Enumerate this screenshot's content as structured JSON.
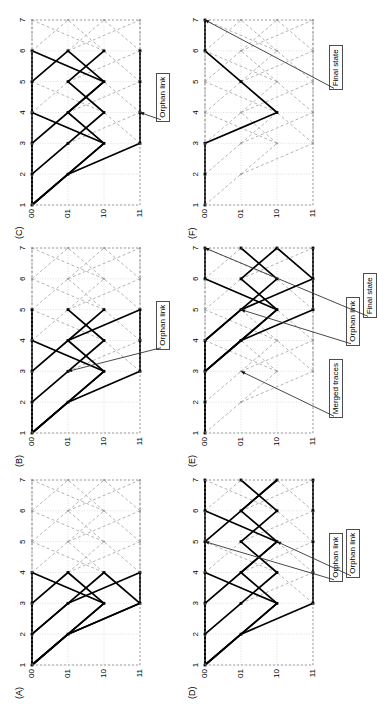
{
  "figure": {
    "orientation": "rotated-90-ccw",
    "canvas": {
      "width": 325,
      "height": 705
    },
    "background": "#ffffff",
    "colors": {
      "trellis_dashed": "#9a9a9a",
      "survivor_path": "#000000",
      "grid": "#c8c8c8",
      "annotation_border": "#4d4d4d",
      "text": "#000000"
    },
    "axes": {
      "time_label_values": [
        "1",
        "2",
        "3",
        "4",
        "5",
        "6",
        "7"
      ],
      "state_label_values": [
        "00",
        "01",
        "10",
        "11"
      ],
      "time_count": 7,
      "state_count": 4
    }
  },
  "panels": [
    {
      "id": "A",
      "label": "(A)",
      "grid_pos": {
        "row": 0,
        "col": 0
      },
      "time_labels": [
        "1",
        "2",
        "3",
        "4",
        "5",
        "6",
        "7"
      ],
      "state_labels": [
        "00",
        "01",
        "10",
        "11"
      ],
      "decoded_depth": 4,
      "annotations": [],
      "survivor_paths": [
        [
          [
            1,
            0
          ],
          [
            2,
            0
          ],
          [
            3,
            0
          ],
          [
            4,
            0
          ]
        ],
        [
          [
            1,
            0
          ],
          [
            2,
            0
          ],
          [
            3,
            0
          ],
          [
            4,
            1
          ]
        ],
        [
          [
            1,
            0
          ],
          [
            2,
            0
          ],
          [
            3,
            1
          ],
          [
            4,
            2
          ]
        ],
        [
          [
            1,
            0
          ],
          [
            2,
            0
          ],
          [
            3,
            1
          ],
          [
            4,
            3
          ]
        ],
        [
          [
            1,
            0
          ],
          [
            2,
            1
          ],
          [
            3,
            2
          ],
          [
            4,
            1
          ]
        ],
        [
          [
            1,
            0
          ],
          [
            2,
            1
          ],
          [
            3,
            2
          ],
          [
            4,
            0
          ]
        ],
        [
          [
            1,
            0
          ],
          [
            2,
            1
          ],
          [
            3,
            3
          ],
          [
            4,
            2
          ]
        ],
        [
          [
            1,
            0
          ],
          [
            2,
            1
          ],
          [
            3,
            3
          ],
          [
            4,
            3
          ]
        ]
      ]
    },
    {
      "id": "B",
      "label": "(B)",
      "grid_pos": {
        "row": 0,
        "col": 1
      },
      "time_labels": [
        "1",
        "2",
        "3",
        "4",
        "5",
        "6",
        "7"
      ],
      "state_labels": [
        "00",
        "01",
        "10",
        "11"
      ],
      "decoded_depth": 5,
      "annotations": [
        {
          "text": "Orphan link",
          "target_time": 3,
          "target_state": 1
        }
      ],
      "survivor_paths": [
        [
          [
            1,
            0
          ],
          [
            2,
            0
          ],
          [
            3,
            0
          ],
          [
            4,
            0
          ],
          [
            5,
            0
          ]
        ],
        [
          [
            1,
            0
          ],
          [
            2,
            0
          ],
          [
            3,
            0
          ],
          [
            4,
            1
          ],
          [
            5,
            2
          ]
        ],
        [
          [
            1,
            0
          ],
          [
            2,
            0
          ],
          [
            3,
            1
          ],
          [
            4,
            2
          ],
          [
            5,
            1
          ]
        ],
        [
          [
            1,
            0
          ],
          [
            2,
            1
          ],
          [
            3,
            2
          ],
          [
            4,
            1
          ],
          [
            5,
            3
          ]
        ],
        [
          [
            1,
            0
          ],
          [
            2,
            1
          ],
          [
            3,
            3
          ],
          [
            4,
            3
          ],
          [
            5,
            3
          ]
        ],
        [
          [
            1,
            0
          ],
          [
            2,
            1
          ],
          [
            3,
            2
          ],
          [
            4,
            0
          ],
          [
            5,
            0
          ]
        ]
      ]
    },
    {
      "id": "C",
      "label": "(C)",
      "grid_pos": {
        "row": 0,
        "col": 2
      },
      "time_labels": [
        "1",
        "2",
        "3",
        "4",
        "5",
        "6",
        "7"
      ],
      "state_labels": [
        "00",
        "01",
        "10",
        "11"
      ],
      "decoded_depth": 6,
      "annotations": [
        {
          "text": "Orphan link",
          "target_time": 4,
          "target_state": 3
        }
      ],
      "survivor_paths": [
        [
          [
            1,
            0
          ],
          [
            2,
            0
          ],
          [
            3,
            0
          ],
          [
            4,
            0
          ],
          [
            5,
            0
          ],
          [
            6,
            0
          ]
        ],
        [
          [
            1,
            0
          ],
          [
            2,
            0
          ],
          [
            3,
            0
          ],
          [
            4,
            1
          ],
          [
            5,
            2
          ],
          [
            6,
            1
          ]
        ],
        [
          [
            1,
            0
          ],
          [
            2,
            1
          ],
          [
            3,
            2
          ],
          [
            4,
            1
          ],
          [
            5,
            2
          ],
          [
            6,
            0
          ]
        ],
        [
          [
            1,
            0
          ],
          [
            2,
            1
          ],
          [
            3,
            3
          ],
          [
            4,
            3
          ],
          [
            5,
            3
          ],
          [
            6,
            3
          ]
        ],
        [
          [
            1,
            0
          ],
          [
            2,
            0
          ],
          [
            3,
            1
          ],
          [
            4,
            2
          ],
          [
            5,
            1
          ],
          [
            6,
            2
          ]
        ],
        [
          [
            1,
            0
          ],
          [
            2,
            1
          ],
          [
            3,
            2
          ],
          [
            4,
            0
          ],
          [
            5,
            0
          ],
          [
            6,
            1
          ]
        ]
      ]
    },
    {
      "id": "D",
      "label": "(D)",
      "grid_pos": {
        "row": 1,
        "col": 0
      },
      "time_labels": [
        "1",
        "2",
        "3",
        "4",
        "5",
        "6",
        "7"
      ],
      "state_labels": [
        "00",
        "01",
        "10",
        "11"
      ],
      "decoded_depth": 7,
      "annotations": [
        {
          "text": "Orphan link",
          "target_time": 5,
          "target_state": 0
        },
        {
          "text": "Orphan link",
          "target_time": 5,
          "target_state": 2
        }
      ],
      "survivor_paths": [
        [
          [
            1,
            0
          ],
          [
            2,
            0
          ],
          [
            3,
            0
          ],
          [
            4,
            0
          ],
          [
            5,
            0
          ],
          [
            6,
            0
          ],
          [
            7,
            0
          ]
        ],
        [
          [
            1,
            0
          ],
          [
            2,
            0
          ],
          [
            3,
            0
          ],
          [
            4,
            1
          ],
          [
            5,
            2
          ],
          [
            6,
            1
          ],
          [
            7,
            2
          ]
        ],
        [
          [
            1,
            0
          ],
          [
            2,
            1
          ],
          [
            3,
            2
          ],
          [
            4,
            1
          ],
          [
            5,
            2
          ],
          [
            6,
            0
          ],
          [
            7,
            0
          ]
        ],
        [
          [
            1,
            0
          ],
          [
            2,
            1
          ],
          [
            3,
            3
          ],
          [
            4,
            3
          ],
          [
            5,
            3
          ],
          [
            6,
            3
          ],
          [
            7,
            3
          ]
        ],
        [
          [
            1,
            0
          ],
          [
            2,
            0
          ],
          [
            3,
            1
          ],
          [
            4,
            2
          ],
          [
            5,
            1
          ],
          [
            6,
            2
          ],
          [
            7,
            1
          ]
        ],
        [
          [
            1,
            0
          ],
          [
            2,
            1
          ],
          [
            3,
            2
          ],
          [
            4,
            0
          ],
          [
            5,
            0
          ],
          [
            6,
            1
          ],
          [
            7,
            2
          ]
        ]
      ]
    },
    {
      "id": "E",
      "label": "(E)",
      "grid_pos": {
        "row": 1,
        "col": 1
      },
      "time_labels": [
        "1",
        "2",
        "3",
        "4",
        "5",
        "6",
        "7"
      ],
      "state_labels": [
        "00",
        "01",
        "10",
        "11"
      ],
      "decoded_depth": 7,
      "annotations": [
        {
          "text": "Merged traces",
          "target_time": 3,
          "target_state": 1
        },
        {
          "text": "Orphan link",
          "target_time": 5,
          "target_state": 1
        },
        {
          "text": "Final state",
          "target_time": 7,
          "target_state": 0
        }
      ],
      "survivor_paths": [
        [
          [
            1,
            0
          ],
          [
            2,
            0
          ],
          [
            3,
            0
          ],
          [
            4,
            1
          ],
          [
            5,
            2
          ],
          [
            6,
            0
          ],
          [
            7,
            0
          ]
        ],
        [
          [
            1,
            0
          ],
          [
            2,
            0
          ],
          [
            3,
            0
          ],
          [
            4,
            1
          ],
          [
            5,
            2
          ],
          [
            6,
            1
          ],
          [
            7,
            2
          ]
        ],
        [
          [
            1,
            0
          ],
          [
            2,
            0
          ],
          [
            3,
            0
          ],
          [
            4,
            0
          ],
          [
            5,
            1
          ],
          [
            6,
            2
          ],
          [
            7,
            1
          ]
        ],
        [
          [
            1,
            0
          ],
          [
            2,
            0
          ],
          [
            3,
            0
          ],
          [
            4,
            1
          ],
          [
            5,
            3
          ],
          [
            6,
            3
          ],
          [
            7,
            2
          ]
        ],
        [
          [
            1,
            0
          ],
          [
            2,
            0
          ],
          [
            3,
            0
          ],
          [
            4,
            0
          ],
          [
            5,
            1
          ],
          [
            6,
            3
          ],
          [
            7,
            3
          ]
        ]
      ]
    },
    {
      "id": "F",
      "label": "(F)",
      "grid_pos": {
        "row": 1,
        "col": 2
      },
      "time_labels": [
        "1",
        "2",
        "3",
        "4",
        "5",
        "6",
        "7"
      ],
      "state_labels": [
        "00",
        "01",
        "10",
        "11"
      ],
      "decoded_depth": 7,
      "annotations": [
        {
          "text": "Final state",
          "target_time": 7,
          "target_state": 0
        }
      ],
      "survivor_paths": [
        [
          [
            1,
            0
          ],
          [
            2,
            0
          ],
          [
            3,
            0
          ],
          [
            4,
            2
          ],
          [
            5,
            1
          ],
          [
            6,
            0
          ],
          [
            7,
            0
          ]
        ]
      ]
    }
  ],
  "annotation_texts": {
    "orphan_link": "Orphan link",
    "merged_traces": "Merged traces",
    "final_state": "Final state"
  }
}
